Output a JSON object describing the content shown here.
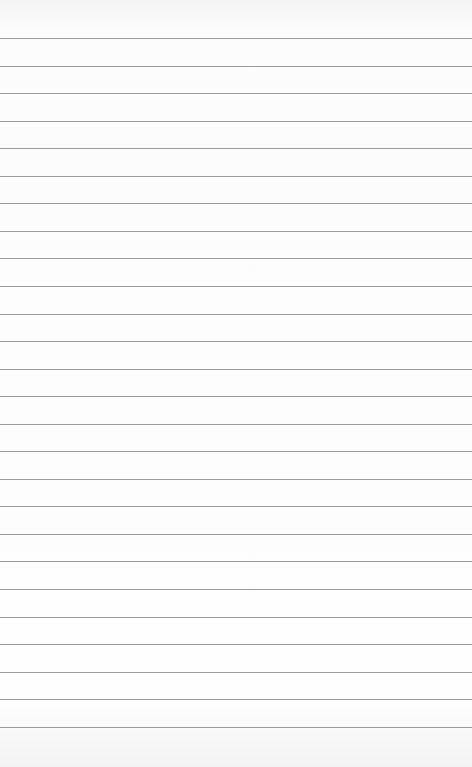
{
  "paper": {
    "type": "lined-paper",
    "background_color": "#fbfbfb",
    "line_color": "#8a8a8a",
    "line_count": 26,
    "first_line_y": 38,
    "line_spacing": 27.55,
    "text": ""
  }
}
